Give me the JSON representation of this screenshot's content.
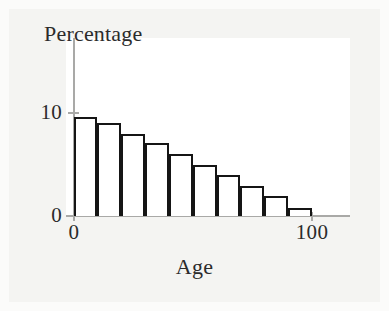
{
  "figure": {
    "background_color": "#f4f4f2",
    "plot_background_color": "#ffffff",
    "axis_color": "#a9a9a7",
    "bar_edge_color": "#151515",
    "bar_fill_color": "#ffffff"
  },
  "axes": {
    "y_title": "Percentage",
    "x_title": "Age",
    "y_ticks": [
      {
        "label": "0",
        "value": 0
      },
      {
        "label": "10",
        "value": 10
      }
    ],
    "x_ticks": [
      {
        "label": "0",
        "value": 0
      },
      {
        "label": "100",
        "value": 100
      }
    ]
  },
  "chart_data": {
    "type": "bar",
    "title": "",
    "xlabel": "Age",
    "ylabel": "Percentage",
    "xlim": [
      0,
      120
    ],
    "ylim": [
      0,
      11.5
    ],
    "grid": false,
    "legend": null,
    "bin_width": 10,
    "bin_edges": [
      0,
      10,
      20,
      30,
      40,
      50,
      60,
      70,
      80,
      90,
      100
    ],
    "categories": [
      "0-10",
      "10-20",
      "20-30",
      "30-40",
      "40-50",
      "50-60",
      "60-70",
      "70-80",
      "80-90",
      "90-100"
    ],
    "x": [
      5,
      15,
      25,
      35,
      45,
      55,
      65,
      75,
      85,
      95
    ],
    "values": [
      9.6,
      9.0,
      8.0,
      7.1,
      6.0,
      5.0,
      4.0,
      2.9,
      1.9,
      0.8
    ],
    "axis_tick_labels_x": [
      "0",
      "100"
    ],
    "axis_tick_labels_y": [
      "0",
      "10"
    ]
  }
}
